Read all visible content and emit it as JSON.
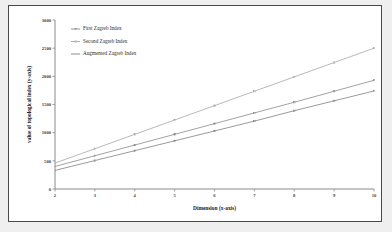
{
  "chart_data": {
    "type": "line",
    "title": "",
    "xlabel": "Dimension (x-axis)",
    "ylabel": "value of topological index (y-axis)",
    "x": [
      2,
      3,
      4,
      5,
      6,
      7,
      8,
      9,
      10
    ],
    "xticks": [
      "2",
      "3",
      "4",
      "5",
      "6",
      "7",
      "8",
      "9",
      "10"
    ],
    "yticks": [
      "0",
      "500",
      "1000",
      "1500",
      "2000",
      "2500",
      "3000"
    ],
    "xlim": [
      2,
      10
    ],
    "ylim": [
      0,
      3000
    ],
    "grid": false,
    "legend_position": "top-left",
    "series": [
      {
        "name": "First Zagreb Index",
        "color": "#7a7a7a",
        "marker": "dash-dot",
        "values": [
          400,
          590,
          780,
          970,
          1160,
          1350,
          1540,
          1735,
          1930
        ]
      },
      {
        "name": "Second Zagreb Index",
        "color": "#9a9a9a",
        "marker": "dot",
        "values": [
          460,
          715,
          970,
          1225,
          1480,
          1735,
          1990,
          2245,
          2500
        ]
      },
      {
        "name": "Augmented Zagreb Index",
        "color": "#6e6e6e",
        "marker": "line",
        "values": [
          330,
          505,
          680,
          855,
          1030,
          1205,
          1390,
          1565,
          1740
        ]
      }
    ]
  },
  "figure": {
    "background_color": "#ffffff",
    "page_background_color": "#efefef",
    "border_color": "#4a4a4a"
  }
}
